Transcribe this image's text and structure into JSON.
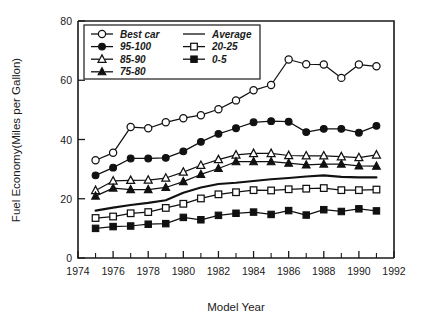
{
  "chart_data": {
    "type": "line",
    "title": "",
    "xlabel": "Model Year",
    "ylabel": "Fuel Economy(Miles per Gallon)",
    "xlim": [
      1974,
      1992
    ],
    "ylim": [
      0,
      80
    ],
    "xticks": [
      1974,
      1976,
      1978,
      1980,
      1982,
      1984,
      1986,
      1988,
      1990,
      1992
    ],
    "xtick_labels": [
      "1974",
      "1976",
      "1978",
      "1980",
      "1982",
      "1984",
      "1986",
      "1988",
      "1990",
      "1992"
    ],
    "yticks": [
      0,
      20,
      40,
      60,
      80
    ],
    "ytick_labels": [
      "0",
      "20",
      "40",
      "60",
      "80"
    ],
    "minor_xticks": [
      1975,
      1977,
      1979,
      1981,
      1983,
      1985,
      1987,
      1989,
      1991
    ],
    "grid": false,
    "legend_position": "upper-left",
    "x": [
      1975,
      1976,
      1977,
      1978,
      1979,
      1980,
      1981,
      1982,
      1983,
      1984,
      1985,
      1986,
      1987,
      1988,
      1989,
      1990,
      1991
    ],
    "series": [
      {
        "name": "Best car",
        "marker": "circle-open",
        "values": [
          33.0,
          35.5,
          44.2,
          43.8,
          45.8,
          47.2,
          48.2,
          50.2,
          53.2,
          56.6,
          58.4,
          67.0,
          65.4,
          65.3,
          60.8,
          65.3,
          64.7
        ]
      },
      {
        "name": "95-100",
        "marker": "circle-filled",
        "values": [
          27.9,
          30.5,
          33.6,
          33.6,
          33.8,
          36.0,
          39.2,
          41.9,
          43.8,
          45.8,
          46.2,
          46.0,
          42.5,
          43.6,
          43.6,
          42.3,
          44.6
        ]
      },
      {
        "name": "85-90",
        "marker": "triangle-open",
        "values": [
          22.8,
          26.0,
          26.2,
          26.3,
          27.0,
          29.0,
          31.3,
          33.2,
          34.8,
          35.3,
          35.3,
          34.6,
          34.5,
          34.5,
          34.2,
          33.9,
          34.8
        ]
      },
      {
        "name": "75-80",
        "marker": "triangle-filled",
        "values": [
          20.9,
          23.6,
          23.1,
          23.1,
          23.8,
          25.8,
          28.2,
          30.2,
          32.5,
          32.5,
          32.5,
          32.0,
          31.4,
          31.7,
          31.7,
          31.1,
          31.0
        ]
      },
      {
        "name": "Average",
        "marker": "none",
        "values": [
          16.0,
          17.0,
          17.9,
          18.6,
          19.5,
          22.0,
          23.8,
          25.0,
          25.4,
          26.0,
          26.6,
          27.0,
          27.5,
          27.9,
          27.4,
          27.2,
          27.2
        ]
      },
      {
        "name": "20-25",
        "marker": "square-open",
        "values": [
          13.5,
          14.0,
          15.1,
          15.5,
          16.9,
          18.3,
          20.1,
          21.5,
          22.2,
          22.9,
          22.8,
          23.2,
          23.4,
          23.6,
          22.9,
          22.9,
          23.1
        ]
      },
      {
        "name": "0-5",
        "marker": "square-filled",
        "values": [
          10.0,
          10.6,
          10.8,
          11.4,
          11.6,
          13.7,
          12.9,
          14.4,
          15.1,
          15.5,
          14.7,
          16.0,
          14.5,
          16.3,
          15.7,
          16.6,
          15.9
        ]
      }
    ]
  },
  "legend": {
    "entries": [
      {
        "label": "Best car",
        "marker": "circle-open"
      },
      {
        "label": "95-100",
        "marker": "circle-filled"
      },
      {
        "label": "85-90",
        "marker": "triangle-open"
      },
      {
        "label": "75-80",
        "marker": "triangle-filled"
      },
      {
        "label": "Average",
        "marker": "line"
      },
      {
        "label": "20-25",
        "marker": "square-open"
      },
      {
        "label": "0-5",
        "marker": "square-filled"
      }
    ]
  },
  "colors": {
    "ink": "#111111",
    "background": "#ffffff"
  }
}
